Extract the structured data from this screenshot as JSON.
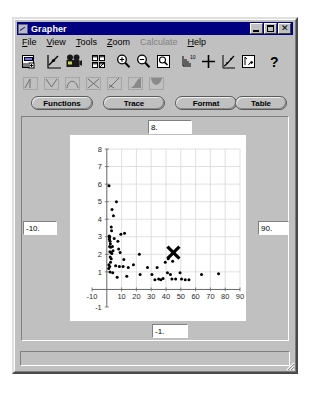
{
  "window": {
    "title": "Grapher",
    "icon": "grapher-app-icon",
    "controls": [
      {
        "name": "minimize-button",
        "glyph": "_"
      },
      {
        "name": "maximize-button",
        "glyph": "□"
      },
      {
        "name": "close-button",
        "glyph": "✕"
      }
    ]
  },
  "menu": {
    "items": [
      {
        "label": "File",
        "accel": "F",
        "disabled": false
      },
      {
        "label": "View",
        "accel": "V",
        "disabled": false
      },
      {
        "label": "Tools",
        "accel": "T",
        "disabled": false
      },
      {
        "label": "Zoom",
        "accel": "Z",
        "disabled": false
      },
      {
        "label": "Calculate",
        "accel": "C",
        "disabled": true
      },
      {
        "label": "Help",
        "accel": "H",
        "disabled": false
      }
    ]
  },
  "toolbar": {
    "buttons": [
      {
        "name": "new-document-icon",
        "label": "New"
      },
      {
        "name": "plot-graph-icon",
        "label": "Graph"
      },
      {
        "name": "movie-camera-icon",
        "label": "Animate"
      },
      {
        "name": "grid-windows-icon",
        "label": "Tile Windows"
      },
      {
        "name": "zoom-in-icon",
        "label": "Zoom In"
      },
      {
        "name": "zoom-out-icon",
        "label": "Zoom Out"
      },
      {
        "name": "zoom-box-icon",
        "label": "Zoom Box"
      },
      {
        "name": "axes-scale-icon",
        "label": "Axes"
      },
      {
        "name": "crosshair-icon",
        "label": "Crosshair"
      },
      {
        "name": "regression-curve-icon",
        "label": "Regression"
      },
      {
        "name": "statistics-plot-icon",
        "label": "Statistics"
      },
      {
        "name": "help-question-icon",
        "label": "?"
      }
    ],
    "shape_buttons": [
      {
        "name": "triangle-curve-icon",
        "label": "Linear"
      },
      {
        "name": "v-curve-icon",
        "label": "Absolute"
      },
      {
        "name": "arch-curve-icon",
        "label": "Quadratic"
      },
      {
        "name": "cross-curve-icon",
        "label": "Rational"
      },
      {
        "name": "slope-curve-icon",
        "label": "Slope"
      },
      {
        "name": "filled-peak-icon",
        "label": "Exponential"
      },
      {
        "name": "filled-valley-icon",
        "label": "Logistic"
      }
    ]
  },
  "modes": {
    "functions": "Functions",
    "trace": "Trace",
    "format": "Format",
    "table": "Table"
  },
  "ranges": {
    "top": "8.",
    "left": "-10.",
    "right": "90.",
    "bottom": "-1."
  },
  "status": {
    "text": ""
  },
  "chart_data": {
    "type": "scatter",
    "title": "",
    "xlabel": "",
    "ylabel": "",
    "xlim": [
      -10,
      90
    ],
    "ylim": [
      -1,
      8
    ],
    "grid": true,
    "legend": false,
    "xticks": [
      -10,
      0,
      10,
      20,
      30,
      40,
      50,
      60,
      70,
      80,
      90
    ],
    "xticklabels": [
      "-10",
      "",
      "10",
      "20",
      "30",
      "40",
      "50",
      "60",
      "70",
      "80",
      "90"
    ],
    "yticks": [
      -1,
      0,
      1,
      2,
      3,
      4,
      5,
      6,
      7,
      8
    ],
    "yticklabels": [
      "-1",
      "",
      "1",
      "2",
      "3",
      "4",
      "5",
      "6",
      "7",
      "8"
    ],
    "series": [
      {
        "name": "data-points",
        "marker": "dot",
        "color": "#000000",
        "points": [
          [
            1.5,
            5.9
          ],
          [
            6.5,
            5.0
          ],
          [
            3.5,
            4.55
          ],
          [
            4.5,
            4.2
          ],
          [
            3.0,
            3.55
          ],
          [
            3.2,
            3.35
          ],
          [
            9.5,
            3.15
          ],
          [
            12.0,
            3.2
          ],
          [
            1.6,
            3.05
          ],
          [
            1.7,
            2.95
          ],
          [
            1.8,
            2.85
          ],
          [
            2.0,
            3.0
          ],
          [
            2.2,
            2.75
          ],
          [
            2.4,
            2.6
          ],
          [
            5.0,
            2.9
          ],
          [
            7.5,
            2.75
          ],
          [
            1.9,
            2.45
          ],
          [
            2.6,
            2.4
          ],
          [
            3.8,
            2.45
          ],
          [
            8.0,
            2.3
          ],
          [
            2.1,
            2.15
          ],
          [
            2.8,
            2.1
          ],
          [
            3.4,
            2.05
          ],
          [
            4.2,
            2.2
          ],
          [
            9.0,
            2.1
          ],
          [
            22.0,
            2.0
          ],
          [
            2.3,
            1.85
          ],
          [
            3.0,
            1.75
          ],
          [
            11.5,
            1.7
          ],
          [
            2.5,
            1.55
          ],
          [
            1.4,
            1.4
          ],
          [
            2.0,
            1.3
          ],
          [
            1.3,
            1.2
          ],
          [
            6.0,
            1.35
          ],
          [
            8.5,
            1.3
          ],
          [
            11.0,
            1.3
          ],
          [
            14.5,
            1.25
          ],
          [
            18.0,
            1.4
          ],
          [
            27.5,
            1.25
          ],
          [
            34.0,
            1.25
          ],
          [
            39.5,
            1.55
          ],
          [
            41.5,
            1.75
          ],
          [
            44.5,
            1.6
          ],
          [
            2.2,
            1.0
          ],
          [
            4.0,
            0.95
          ],
          [
            7.0,
            0.7
          ],
          [
            13.5,
            0.75
          ],
          [
            22.5,
            0.85
          ],
          [
            30.5,
            0.85
          ],
          [
            32.5,
            0.55
          ],
          [
            35.0,
            0.6
          ],
          [
            36.5,
            0.55
          ],
          [
            38.0,
            0.62
          ],
          [
            41.0,
            0.95
          ],
          [
            43.0,
            0.85
          ],
          [
            44.0,
            0.6
          ],
          [
            46.5,
            0.6
          ],
          [
            49.5,
            0.95
          ],
          [
            50.5,
            0.6
          ],
          [
            53.0,
            0.55
          ],
          [
            55.5,
            0.55
          ],
          [
            64.0,
            0.85
          ],
          [
            75.5,
            0.9
          ]
        ]
      },
      {
        "name": "trace-marker",
        "marker": "x",
        "color": "#000000",
        "points": [
          [
            45.0,
            2.1
          ]
        ]
      }
    ]
  }
}
